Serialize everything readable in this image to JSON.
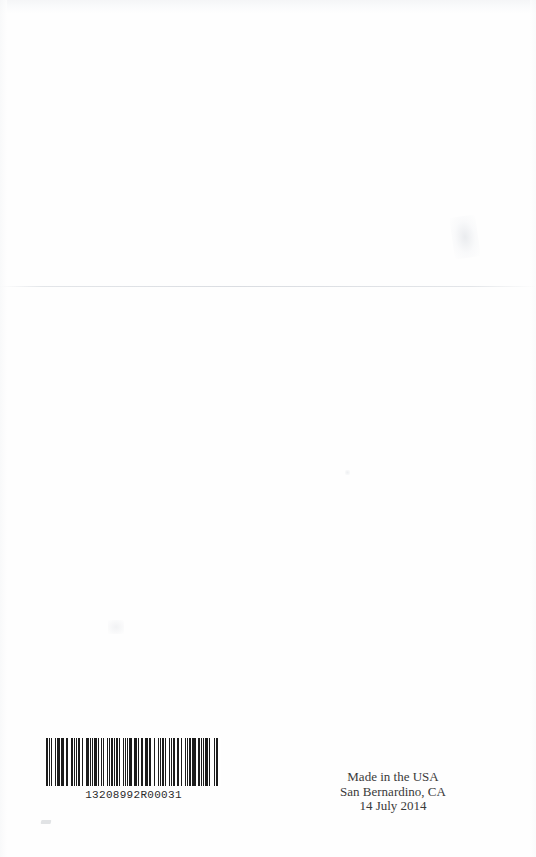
{
  "page": {
    "type": "scanned-book-back-cover",
    "background_color": "#fefefe",
    "width": 536,
    "height": 857
  },
  "barcode": {
    "symbology": "code-128",
    "human_readable_number": "13208992R00031",
    "ink_color": "#1c1c1c",
    "bar_pattern": [
      2,
      1,
      1,
      2,
      1,
      3,
      1,
      1,
      2,
      1,
      1,
      1,
      3,
      2,
      1,
      1,
      1,
      3,
      2,
      1,
      1,
      2,
      1,
      1,
      2,
      2,
      1,
      1,
      1,
      2,
      3,
      1,
      1,
      1,
      2,
      1,
      3,
      1,
      1,
      2,
      2,
      1,
      1,
      3,
      1,
      1,
      2,
      1,
      2,
      1,
      1,
      1,
      2,
      2,
      1,
      3,
      1,
      1,
      1,
      2,
      1,
      1,
      3,
      2,
      1,
      1,
      2,
      1,
      1,
      2,
      2,
      1,
      1,
      1,
      3,
      1,
      2,
      1,
      1,
      2,
      1,
      3,
      1,
      1,
      2,
      1,
      2,
      1,
      1,
      3,
      2,
      1,
      1,
      1,
      2,
      2,
      1,
      1,
      1,
      2,
      1,
      3,
      2,
      1,
      1,
      1,
      2,
      1,
      3,
      1,
      1,
      2,
      2,
      1,
      1,
      2,
      1,
      1,
      3,
      1,
      1,
      2,
      1,
      2,
      1,
      1,
      2,
      3
    ]
  },
  "imprint": {
    "lines": [
      "Made in the USA",
      "San Bernardino, CA",
      "14 July 2014"
    ],
    "line_1": "Made in the USA",
    "line_2": "San Bernardino, CA",
    "line_3": "14 July 2014",
    "text_color": "#3a3a3a"
  }
}
